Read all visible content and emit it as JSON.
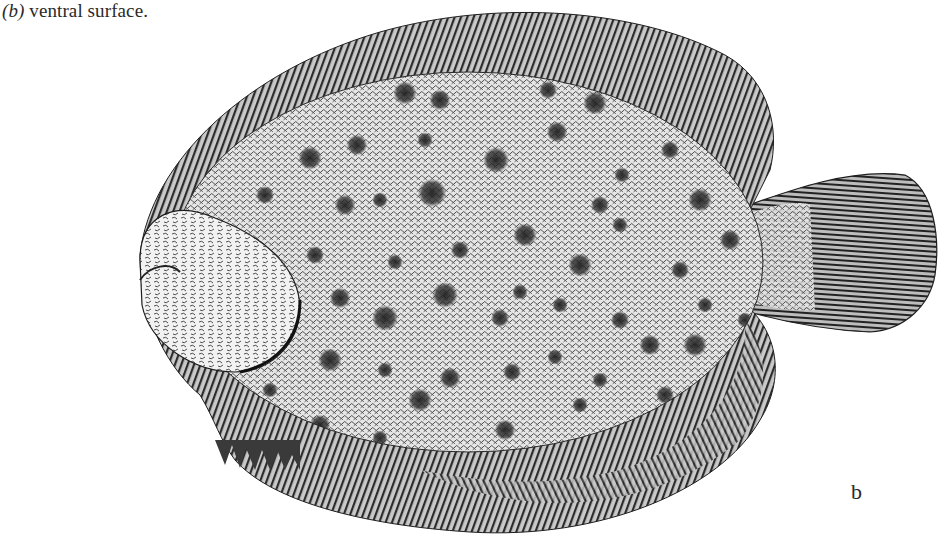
{
  "caption": {
    "label": "(b)",
    "text": " ventral surface."
  },
  "panel_letter": "b",
  "figure": {
    "style": "monochrome stipple engraving",
    "colors": {
      "background": "#ffffff",
      "ink": "#1e1e1e",
      "body_fill": "#cfcfcf",
      "fin_fill": "#9a9a9a",
      "spot": "#2b2b2b"
    },
    "spots": [
      [
        405,
        93,
        9
      ],
      [
        440,
        100,
        8
      ],
      [
        548,
        90,
        7
      ],
      [
        595,
        103,
        9
      ],
      [
        650,
        95,
        7
      ],
      [
        310,
        158,
        9
      ],
      [
        357,
        145,
        8
      ],
      [
        425,
        140,
        6
      ],
      [
        496,
        160,
        10
      ],
      [
        557,
        132,
        8
      ],
      [
        622,
        175,
        6
      ],
      [
        670,
        150,
        7
      ],
      [
        265,
        195,
        7
      ],
      [
        345,
        205,
        8
      ],
      [
        380,
        200,
        6
      ],
      [
        432,
        193,
        11
      ],
      [
        525,
        235,
        9
      ],
      [
        600,
        205,
        7
      ],
      [
        700,
        200,
        9
      ],
      [
        730,
        240,
        8
      ],
      [
        315,
        255,
        7
      ],
      [
        395,
        262,
        6
      ],
      [
        460,
        250,
        7
      ],
      [
        520,
        292,
        6
      ],
      [
        580,
        265,
        9
      ],
      [
        620,
        225,
        6
      ],
      [
        680,
        270,
        7
      ],
      [
        705,
        305,
        6
      ],
      [
        340,
        298,
        8
      ],
      [
        385,
        318,
        10
      ],
      [
        445,
        295,
        10
      ],
      [
        500,
        318,
        7
      ],
      [
        560,
        305,
        6
      ],
      [
        620,
        320,
        7
      ],
      [
        650,
        345,
        8
      ],
      [
        695,
        345,
        9
      ],
      [
        745,
        320,
        6
      ],
      [
        278,
        340,
        6
      ],
      [
        330,
        360,
        9
      ],
      [
        385,
        370,
        6
      ],
      [
        450,
        378,
        8
      ],
      [
        512,
        372,
        7
      ],
      [
        555,
        357,
        6
      ],
      [
        600,
        380,
        6
      ],
      [
        665,
        395,
        7
      ],
      [
        320,
        425,
        8
      ],
      [
        380,
        438,
        6
      ],
      [
        420,
        400,
        9
      ],
      [
        505,
        430,
        8
      ],
      [
        580,
        405,
        6
      ],
      [
        610,
        440,
        6
      ],
      [
        700,
        410,
        6
      ],
      [
        270,
        390,
        6
      ],
      [
        240,
        415,
        5
      ]
    ]
  }
}
